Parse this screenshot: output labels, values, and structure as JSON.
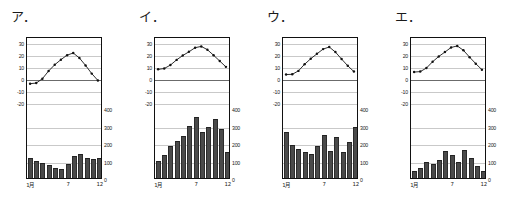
{
  "figure": {
    "title": "",
    "panel_count": 4,
    "axis": {
      "temp_ticks": [
        30,
        20,
        10,
        0,
        -10,
        -20
      ],
      "temp_unit": "℃",
      "precip_ticks": [
        400,
        300,
        200,
        100,
        0
      ],
      "precip_unit": "mm",
      "x_ticks": [
        "1月",
        "7",
        "12"
      ],
      "x_tick_months": [
        1,
        7,
        12
      ],
      "temp_axis_range": [
        -25,
        35
      ],
      "precip_axis_range": [
        0,
        400
      ],
      "grid": true,
      "legend": ""
    },
    "colors": {
      "bar_fill": "#4a4a4a",
      "line": "#111111",
      "grid": "#c9c9c9",
      "frame": "#111111",
      "background": "#ffffff"
    }
  },
  "chart_data": [
    {
      "type": "bar",
      "id": "panel-a",
      "title": "ア．",
      "label": "ア．",
      "categories": [
        "1",
        "2",
        "3",
        "4",
        "5",
        "6",
        "7",
        "8",
        "9",
        "10",
        "11",
        "12"
      ],
      "xlabel": "月",
      "ylabel": "気温（℃）",
      "ylabel2": "降水量（mm）",
      "ylim": [
        -25,
        35
      ],
      "ylim2": [
        0,
        400
      ],
      "series": [
        {
          "name": "降水量",
          "type": "bar",
          "values": [
            112,
            95,
            85,
            72,
            60,
            52,
            78,
            125,
            140,
            112,
            110,
            115
          ]
        },
        {
          "name": "気温",
          "type": "line",
          "values": [
            -3.6,
            -3.1,
            0.6,
            7.1,
            12.4,
            16.7,
            20.5,
            22.3,
            18.1,
            11.8,
            4.9,
            -0.9
          ]
        }
      ]
    },
    {
      "type": "bar",
      "id": "panel-i",
      "title": "イ．",
      "label": "イ．",
      "categories": [
        "1",
        "2",
        "3",
        "4",
        "5",
        "6",
        "7",
        "8",
        "9",
        "10",
        "11",
        "12"
      ],
      "xlabel": "月",
      "ylabel": "気温（℃）",
      "ylabel2": "降水量（mm）",
      "ylim": [
        -25,
        35
      ],
      "ylim2": [
        0,
        400
      ],
      "series": [
        {
          "name": "降水量",
          "type": "bar",
          "values": [
            100,
            130,
            185,
            210,
            240,
            300,
            350,
            265,
            290,
            335,
            280,
            150
          ]
        },
        {
          "name": "気温",
          "type": "line",
          "values": [
            8.5,
            9.2,
            12.1,
            16.5,
            20.2,
            23.3,
            26.8,
            27.9,
            25.1,
            20.4,
            15.5,
            10.6
          ]
        }
      ]
    },
    {
      "type": "bar",
      "id": "panel-u",
      "title": "ウ．",
      "label": "ウ．",
      "categories": [
        "1",
        "2",
        "3",
        "4",
        "5",
        "6",
        "7",
        "8",
        "9",
        "10",
        "11",
        "12"
      ],
      "xlabel": "月",
      "ylabel": "気温（℃）",
      "ylabel2": "降水量（mm）",
      "ylim": [
        -25,
        35
      ],
      "ylim2": [
        0,
        400
      ],
      "series": [
        {
          "name": "降水量",
          "type": "bar",
          "values": [
            265,
            190,
            165,
            150,
            140,
            185,
            245,
            155,
            235,
            150,
            205,
            290
          ]
        },
        {
          "name": "気温",
          "type": "line",
          "values": [
            4.1,
            4.3,
            7.2,
            12.8,
            17.5,
            21.6,
            25.6,
            27.4,
            23.1,
            17.2,
            11.5,
            6.6
          ]
        }
      ]
    },
    {
      "type": "bar",
      "id": "panel-e",
      "title": "エ．",
      "label": "エ．",
      "categories": [
        "1",
        "2",
        "3",
        "4",
        "5",
        "6",
        "7",
        "8",
        "9",
        "10",
        "11",
        "12"
      ],
      "xlabel": "月",
      "ylabel": "気温（℃）",
      "ylabel2": "降水量（mm）",
      "ylim": [
        -25,
        35
      ],
      "ylim2": [
        0,
        400
      ],
      "series": [
        {
          "name": "降水量",
          "type": "bar",
          "values": [
            38,
            55,
            90,
            82,
            105,
            155,
            130,
            90,
            160,
            115,
            70,
            40
          ]
        },
        {
          "name": "気温",
          "type": "line",
          "values": [
            6.2,
            6.6,
            9.6,
            14.9,
            19.4,
            23.1,
            27.0,
            28.3,
            24.6,
            18.8,
            13.3,
            8.2
          ]
        }
      ]
    }
  ]
}
